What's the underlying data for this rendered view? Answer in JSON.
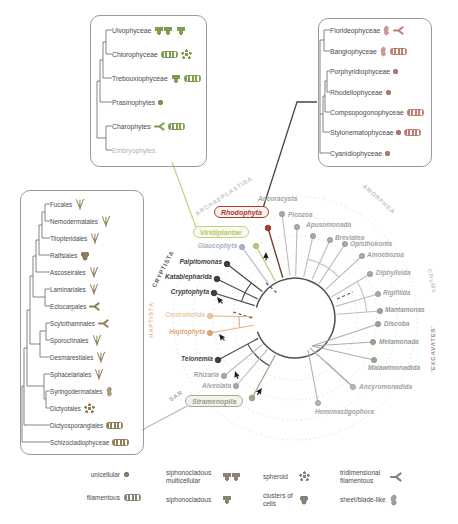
{
  "figure": {
    "name": "eukaryote phylogeny with algal multicellularity"
  },
  "colors": {
    "rhodophyta_red": "#a83c32",
    "viridiplantae_green": "#b3c96e",
    "stramenopila_olive": "#9b9d88",
    "haptista_orange": "#dfa877",
    "cryptista_dark": "#3f3f3f",
    "gray_taxon": "#a3a3a3",
    "green_icons": "#7f9c4f",
    "red_icons": "#bd7b72",
    "brown_icons": "#8f7f58",
    "legend_icons": "#8a8274"
  },
  "boxes": {
    "green": {
      "items": [
        {
          "label": "Ulvophyceae",
          "icons": [
            "siphonocladous-multicellular",
            "siphonocladous",
            "sheet-blade",
            "filamentous"
          ]
        },
        {
          "label": "Chlorophyceae",
          "icons": [
            "filamentous",
            "spheroid",
            "tridimensional-filamentous"
          ]
        },
        {
          "label": "Trebouxiophyceae",
          "icons": [
            "siphonocladous",
            "filamentous",
            "sheet-blade"
          ]
        },
        {
          "label": "Prasinophytes",
          "icons": [
            "unicellular"
          ]
        },
        {
          "label": "Charophytes",
          "icons": [
            "tridimensional-filamentous",
            "filamentous"
          ]
        },
        {
          "label": "Embryophytes",
          "icons": []
        }
      ]
    },
    "red": {
      "items": [
        {
          "label": "Florideophyceae",
          "icons": [
            "sheet-blade",
            "tridimensional-filamentous"
          ]
        },
        {
          "label": "Bangiophyceae",
          "icons": [
            "sheet-blade",
            "filamentous"
          ]
        },
        {
          "label": "Porphyridiophyceae",
          "icons": [
            "unicellular"
          ]
        },
        {
          "label": "Rhodellophyceae",
          "icons": [
            "unicellular"
          ]
        },
        {
          "label": "Compsopogonophyceae",
          "icons": [
            "filamentous"
          ]
        },
        {
          "label": "Stylonematophyceae",
          "icons": [
            "unicellular",
            "filamentous"
          ]
        },
        {
          "label": "Cyanidiophyceae",
          "icons": [
            "unicellular"
          ]
        }
      ]
    },
    "brown": {
      "items": [
        {
          "label": "Fucales",
          "icons": [
            "thallus"
          ]
        },
        {
          "label": "Nemodermatales",
          "icons": [
            "thallus"
          ]
        },
        {
          "label": "Tilopteridales",
          "icons": [
            "thallus"
          ]
        },
        {
          "label": "Ralfsiales",
          "icons": [
            "clusters-of-cells"
          ]
        },
        {
          "label": "Ascoseirales",
          "icons": [
            "thallus"
          ]
        },
        {
          "label": "Laminariales",
          "icons": [
            "thallus"
          ]
        },
        {
          "label": "Ectocarpales",
          "icons": [
            "tridimensional-filamentous"
          ]
        },
        {
          "label": "Scytothamnales",
          "icons": [
            "tridimensional-filamentous"
          ]
        },
        {
          "label": "Sporochnales",
          "icons": [
            "thallus"
          ]
        },
        {
          "label": "Desmarestiales",
          "icons": [
            "thallus"
          ]
        },
        {
          "label": "Sphacelariales",
          "icons": [
            "thallus"
          ]
        },
        {
          "label": "Syringodermatales",
          "icons": [
            "sheet-blade"
          ]
        },
        {
          "label": "Dictyotales",
          "icons": [
            "spheroid"
          ]
        },
        {
          "label": "Dictyosporangiales",
          "icons": [
            "filamentous"
          ]
        },
        {
          "label": "Schizocladiophyceae",
          "icons": [
            "filamentous"
          ]
        }
      ]
    }
  },
  "tree": {
    "clades": {
      "archaeplastida": "ARCHAEPLASTIDA",
      "amorphea": "AMORPHEA",
      "crums": "CRuMs",
      "excavates": "'EXCAVATES'",
      "cryptista": "CRYPTISTA",
      "haptista": "HAPTISTA",
      "sar": "SAR"
    },
    "taxa": [
      {
        "name": "Rhodophyta"
      },
      {
        "name": "Viridiplantae"
      },
      {
        "name": "Glaucophyta"
      },
      {
        "name": "Ancoracysta"
      },
      {
        "name": "Picozoa"
      },
      {
        "name": "Apusomonada"
      },
      {
        "name": "Breviatea"
      },
      {
        "name": "Opisthokonta"
      },
      {
        "name": "Amoebozoa"
      },
      {
        "name": "Diphylleida"
      },
      {
        "name": "Rigifilida"
      },
      {
        "name": "Mantamonas"
      },
      {
        "name": "Discoba"
      },
      {
        "name": "Metamonada"
      },
      {
        "name": "Malawimonadida"
      },
      {
        "name": "Ancyromonadida"
      },
      {
        "name": "Hemimastigophora"
      },
      {
        "name": "Stramenopila"
      },
      {
        "name": "Alveolata"
      },
      {
        "name": "Rhizaria"
      },
      {
        "name": "Telonemia"
      },
      {
        "name": "Haptophyta"
      },
      {
        "name": "Centrohelida"
      },
      {
        "name": "Cryptophyta"
      },
      {
        "name": "Katablepharida"
      },
      {
        "name": "Palpitomonas"
      }
    ]
  },
  "legend": {
    "items": [
      {
        "label": "unicellular",
        "icon": "unicellular"
      },
      {
        "label": "filamentous",
        "icon": "filamentous"
      },
      {
        "label": "siphonocladous multicellular",
        "icon": "siphonocladous-multicellular"
      },
      {
        "label": "siphonocladous",
        "icon": "siphonocladous"
      },
      {
        "label": "spheroid",
        "icon": "spheroid"
      },
      {
        "label": "clusters of cells",
        "icon": "clusters-of-cells"
      },
      {
        "label": "tridimensional filamentous",
        "icon": "tridimensional-filamentous"
      },
      {
        "label": "sheet/blade-like",
        "icon": "sheet-blade"
      }
    ]
  }
}
